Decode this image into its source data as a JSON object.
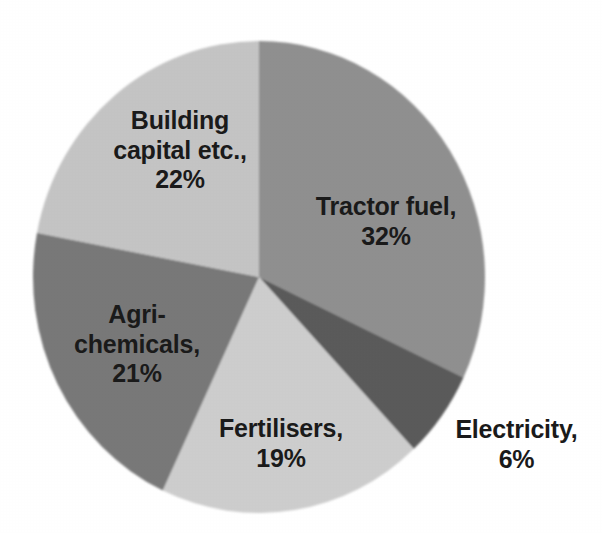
{
  "chart_data": {
    "type": "pie",
    "title": "",
    "subtitle": "",
    "xlabel": "",
    "ylabel": "",
    "legend_position": "none",
    "labels_position": "inside-and-outside",
    "grid": false,
    "units": "%",
    "categories": [
      "Tractor fuel",
      "Electricity",
      "Fertilisers",
      "Agri-chemicals",
      "Building capital etc.",
      "Building capital etc."
    ],
    "slices": [
      {
        "name": "Tractor fuel",
        "label_text": "Tractor fuel,\n32%",
        "value": 32,
        "percent_text": "32%",
        "color": "#8f8f8f",
        "start_angle_deg": 0,
        "end_angle_deg": 115.2,
        "label_inside": true
      },
      {
        "name": "Electricity",
        "label_text": "Electricity,\n6%",
        "value": 6,
        "percent_text": "6%",
        "color": "#5a5a5a",
        "start_angle_deg": 115.2,
        "end_angle_deg": 136.8,
        "label_inside": false
      },
      {
        "name": "Fertilisers",
        "label_text": "Fertilisers,\n19%",
        "value": 19,
        "percent_text": "19%",
        "color": "#cdcdcd",
        "start_angle_deg": 136.8,
        "end_angle_deg": 205.2,
        "label_inside": true
      },
      {
        "name": "Agri-chemicals",
        "label_text": "Agri-\nchemicals,\n21%",
        "value": 21,
        "percent_text": "21%",
        "color": "#787878",
        "start_angle_deg": 205.2,
        "end_angle_deg": 280.8,
        "label_inside": true
      },
      {
        "name": "Building capital etc.",
        "label_text": "Building\ncapital etc.,\n22%",
        "value": 22,
        "percent_text": "22%",
        "color": "#c4c4c4",
        "start_angle_deg": 280.8,
        "end_angle_deg": 360,
        "label_inside": true
      }
    ],
    "total": 100,
    "geometry": {
      "center_x": 259,
      "center_y": 277,
      "radius_x": 226,
      "radius_y": 236
    }
  },
  "colors": {
    "background": "#ffffff",
    "text": "#1a1a1a",
    "tractor_fuel": "#8f8f8f",
    "electricity": "#5a5a5a",
    "fertilisers": "#cdcdcd",
    "agri_chemicals": "#787878",
    "building_capital": "#c4c4c4"
  }
}
